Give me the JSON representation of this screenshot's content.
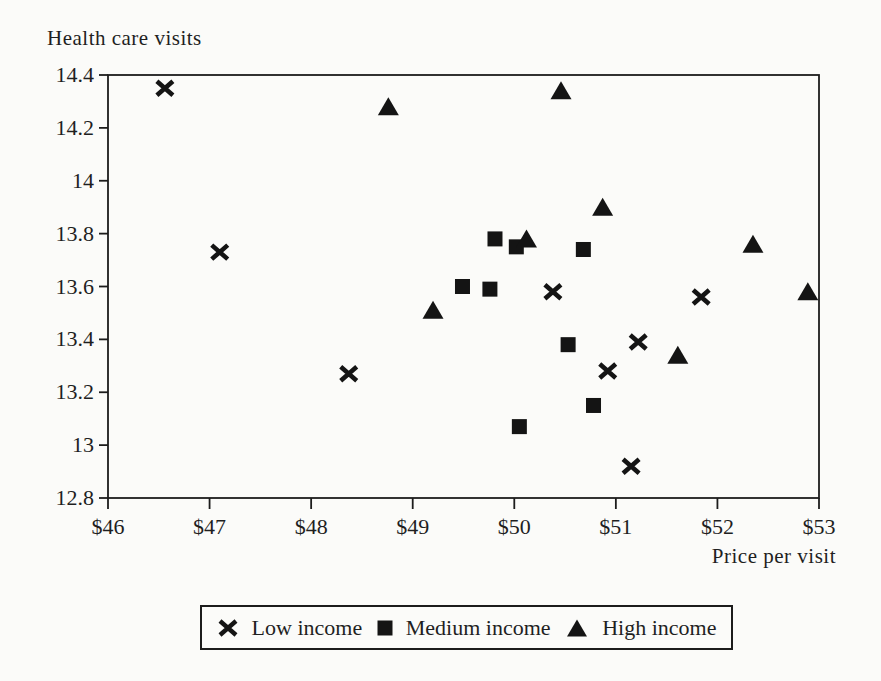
{
  "page": {
    "background_color": "#fbfbf9",
    "ink_color": "#1f1f1f"
  },
  "chart_data": {
    "type": "scatter",
    "ylabel": "Health care visits",
    "xlabel": "Price per visit",
    "xlim": [
      46,
      53
    ],
    "ylim": [
      12.8,
      14.4
    ],
    "grid": false,
    "frame": "full-box",
    "legend_position": "bottom-center-boxed",
    "axis_color": "#1c1c1c",
    "marker_color": "#141414",
    "x_ticks": [
      {
        "value": 46,
        "label": "$46"
      },
      {
        "value": 47,
        "label": "$47"
      },
      {
        "value": 48,
        "label": "$48"
      },
      {
        "value": 49,
        "label": "$49"
      },
      {
        "value": 50,
        "label": "$50"
      },
      {
        "value": 51,
        "label": "$51"
      },
      {
        "value": 52,
        "label": "$52"
      },
      {
        "value": 53,
        "label": "$53"
      }
    ],
    "y_ticks": [
      {
        "value": 12.8,
        "label": "12.8"
      },
      {
        "value": 13,
        "label": "13"
      },
      {
        "value": 13.2,
        "label": "13.2"
      },
      {
        "value": 13.4,
        "label": "13.4"
      },
      {
        "value": 13.6,
        "label": "13.6"
      },
      {
        "value": 13.8,
        "label": "13.8"
      },
      {
        "value": 14,
        "label": "14"
      },
      {
        "value": 14.2,
        "label": "14.2"
      },
      {
        "value": 14.4,
        "label": "14.4"
      }
    ],
    "series": [
      {
        "name": "Low income",
        "marker": "x",
        "points": [
          [
            46.56,
            14.35
          ],
          [
            47.1,
            13.73
          ],
          [
            48.37,
            13.27
          ],
          [
            50.38,
            13.58
          ],
          [
            51.84,
            13.56
          ],
          [
            51.22,
            13.39
          ],
          [
            50.92,
            13.28
          ],
          [
            51.15,
            12.92
          ]
        ]
      },
      {
        "name": "Medium income",
        "marker": "square",
        "points": [
          [
            49.81,
            13.78
          ],
          [
            50.02,
            13.75
          ],
          [
            50.68,
            13.74
          ],
          [
            49.49,
            13.6
          ],
          [
            49.76,
            13.59
          ],
          [
            50.53,
            13.38
          ],
          [
            50.78,
            13.15
          ],
          [
            50.05,
            13.07
          ]
        ]
      },
      {
        "name": "High income",
        "marker": "triangle",
        "points": [
          [
            48.76,
            14.28
          ],
          [
            50.46,
            14.34
          ],
          [
            50.87,
            13.9
          ],
          [
            50.12,
            13.78
          ],
          [
            49.2,
            13.51
          ],
          [
            52.35,
            13.76
          ],
          [
            51.61,
            13.34
          ],
          [
            52.89,
            13.58
          ]
        ]
      }
    ]
  }
}
